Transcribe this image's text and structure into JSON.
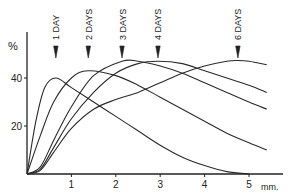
{
  "chart_data": {
    "type": "line",
    "title": "",
    "xlabel": "mm.",
    "ylabel": "%",
    "xlim": [
      0,
      5.6
    ],
    "ylim": [
      0,
      56
    ],
    "x_ticks": [
      "1",
      "2",
      "3",
      "4",
      "5"
    ],
    "y_ticks": [
      "20",
      "40"
    ],
    "grid": false,
    "legend": "none",
    "annotations": [
      {
        "text": "1 DAY",
        "x": 0.65
      },
      {
        "text": "2 DAYS",
        "x": 1.38
      },
      {
        "text": "3 DAYS",
        "x": 2.14
      },
      {
        "text": "4 DAYS",
        "x": 2.95
      },
      {
        "text": "6 DAYS",
        "x": 4.75
      }
    ],
    "series": [
      {
        "name": "1 DAY",
        "x": [
          0,
          0.2,
          0.4,
          0.65,
          1.0,
          1.5,
          2.0,
          2.5,
          3.0,
          3.5,
          4.0,
          4.5,
          5.0
        ],
        "y": [
          0,
          22,
          36,
          40,
          36,
          30,
          24,
          18,
          12,
          7,
          3.5,
          1,
          0
        ]
      },
      {
        "name": "2 DAYS",
        "x": [
          0,
          0.3,
          0.6,
          1.0,
          1.38,
          2.0,
          2.5,
          3.0,
          3.5,
          4.0,
          4.5,
          5.0,
          5.4
        ],
        "y": [
          0,
          16,
          30,
          40,
          43,
          41,
          37,
          32,
          27,
          22,
          17,
          13,
          10
        ]
      },
      {
        "name": "3 DAYS",
        "x": [
          0,
          0.3,
          0.6,
          1.0,
          1.5,
          2.14,
          2.5,
          3.0,
          3.5,
          4.0,
          4.5,
          5.0,
          5.4
        ],
        "y": [
          0,
          3,
          14,
          28,
          41,
          47,
          47,
          45,
          42,
          38,
          34,
          30,
          27
        ]
      },
      {
        "name": "4 DAYS",
        "x": [
          0,
          0.3,
          0.6,
          1.0,
          1.5,
          2.0,
          2.5,
          2.95,
          3.5,
          4.0,
          4.5,
          5.0,
          5.4
        ],
        "y": [
          0,
          2,
          11,
          23,
          34,
          42,
          46,
          47,
          46,
          43,
          40,
          37,
          34
        ]
      },
      {
        "name": "6 DAYS",
        "x": [
          0,
          0.3,
          0.6,
          1.0,
          1.5,
          2.0,
          2.5,
          3.0,
          3.5,
          4.0,
          4.5,
          4.75,
          5.0,
          5.4
        ],
        "y": [
          0,
          1.5,
          9,
          19,
          27,
          31,
          34,
          38,
          42,
          45,
          47,
          47.3,
          47,
          45.5
        ]
      }
    ]
  }
}
